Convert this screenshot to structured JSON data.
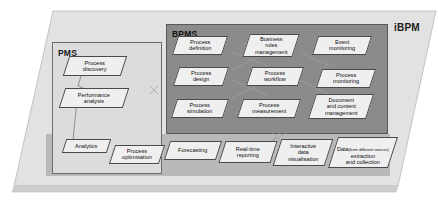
{
  "diagram": {
    "type": "layered-architecture",
    "outer_label": "iBPM",
    "background_colors": {
      "slab": "#e2e2e2",
      "slab_edge": "#cfcfcf",
      "pms_box": "#dcdcdc",
      "bpms_box": "#8b8b8b",
      "bottom_band": "#b9b9b9",
      "node_fill": "#efefef",
      "node_stroke": "#4a4a4a"
    },
    "groups": [
      {
        "id": "pms",
        "label": "PMS"
      },
      {
        "id": "bpms",
        "label": "BPMS"
      }
    ],
    "pms_nodes": [
      {
        "id": "process-discovery",
        "label": "Process\ndiscovery"
      },
      {
        "id": "performance-analysis",
        "label": "Performance\nanalysis"
      },
      {
        "id": "analytics",
        "label": "Analytics"
      },
      {
        "id": "process-optimisation",
        "label": "Process\noptimisation"
      }
    ],
    "bpms_nodes": [
      {
        "id": "process-definition",
        "label": "Process\ndefinition"
      },
      {
        "id": "business-rules-management",
        "label": "Business\nrules\nmanagement"
      },
      {
        "id": "event-monitoring",
        "label": "Event\nmonitoring"
      },
      {
        "id": "process-design",
        "label": "Process\ndesign"
      },
      {
        "id": "process-workflow",
        "label": "Process\nworkflow"
      },
      {
        "id": "process-monitoring",
        "label": "Process\nmonitoring"
      },
      {
        "id": "process-simulation",
        "label": "Process\nsimulation"
      },
      {
        "id": "process-measurement",
        "label": "Process\nmeasurement"
      },
      {
        "id": "document-and-content-management",
        "label": "Document\nand content\nmanagement"
      }
    ],
    "bottom_nodes": [
      {
        "id": "forecasting",
        "label": "Forecasting"
      },
      {
        "id": "real-time-reporting",
        "label": "Real-time\nreporting"
      },
      {
        "id": "interactive-data-visualisation",
        "label": "Interactive\ndata\nvisualisation"
      },
      {
        "id": "data-extraction-and-collection",
        "label_main": "Data",
        "label_sub": "(from different sources)",
        "label_rest": "extraction\nand collection"
      }
    ]
  }
}
